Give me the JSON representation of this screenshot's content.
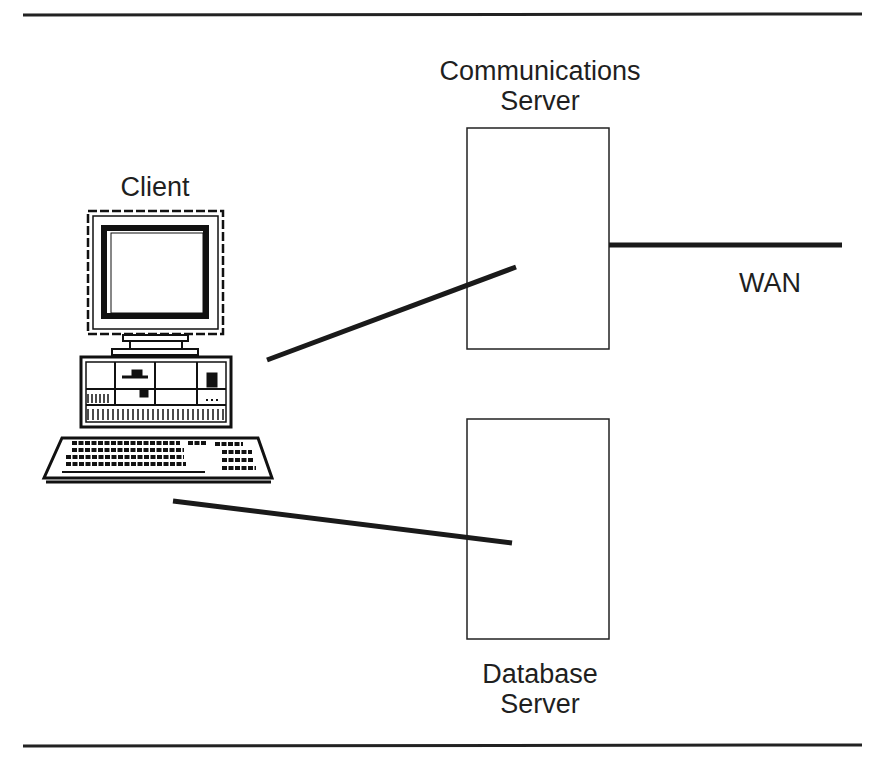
{
  "diagram": {
    "nodes": {
      "client": {
        "label": "Client",
        "icon": "desktop-computer-icon"
      },
      "comm_server": {
        "label_line1": "Communications",
        "label_line2": "Server"
      },
      "db_server": {
        "label_line1": "Database",
        "label_line2": "Server"
      },
      "wan": {
        "label": "WAN"
      }
    },
    "edges": [
      {
        "from": "client",
        "to": "comm_server"
      },
      {
        "from": "client",
        "to": "db_server"
      },
      {
        "from": "comm_server",
        "to": "wan"
      }
    ],
    "colors": {
      "line": "#1a1a1a",
      "background": "#ffffff"
    }
  }
}
